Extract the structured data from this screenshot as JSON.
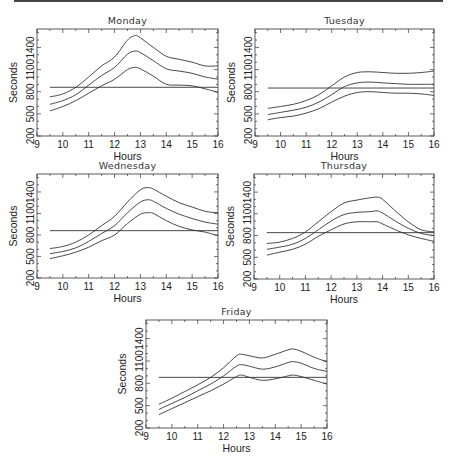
{
  "chart_data": [
    {
      "type": "line",
      "title": "Monday",
      "xlabel": "Hours",
      "ylabel": "Seconds",
      "xlim": [
        9,
        16
      ],
      "ylim": [
        200,
        1650
      ],
      "xticks": [
        9,
        10,
        11,
        12,
        13,
        14,
        15,
        16
      ],
      "yticks": [
        200,
        500,
        800,
        1100,
        1400
      ],
      "grid": false,
      "reference_line": 860,
      "x": [
        9.5,
        10,
        10.5,
        11,
        11.5,
        12,
        12.5,
        12.8,
        13,
        13.5,
        14,
        14.5,
        15,
        15.5,
        16
      ],
      "series": [
        {
          "name": "upper",
          "values": [
            730,
            770,
            860,
            1000,
            1150,
            1270,
            1500,
            1560,
            1530,
            1400,
            1280,
            1240,
            1200,
            1150,
            1150
          ]
        },
        {
          "name": "middle",
          "values": [
            630,
            680,
            760,
            890,
            1020,
            1130,
            1310,
            1350,
            1330,
            1220,
            1110,
            1080,
            1050,
            1000,
            970
          ]
        },
        {
          "name": "lower",
          "values": [
            540,
            600,
            680,
            780,
            880,
            970,
            1100,
            1130,
            1110,
            1010,
            900,
            890,
            880,
            840,
            790
          ]
        }
      ]
    },
    {
      "type": "line",
      "title": "Tuesday",
      "xlabel": "Hours",
      "ylabel": "Seconds",
      "xlim": [
        9,
        16
      ],
      "ylim": [
        200,
        1650
      ],
      "xticks": [
        9,
        10,
        11,
        12,
        13,
        14,
        15,
        16
      ],
      "yticks": [
        200,
        500,
        800,
        1100,
        1400
      ],
      "grid": false,
      "reference_line": 850,
      "x": [
        9.5,
        10,
        10.5,
        11,
        11.5,
        12,
        12.5,
        13,
        13.5,
        14,
        14.5,
        15,
        15.5,
        16
      ],
      "series": [
        {
          "name": "upper",
          "values": [
            575,
            600,
            630,
            680,
            760,
            880,
            1000,
            1060,
            1070,
            1060,
            1050,
            1050,
            1060,
            1080
          ]
        },
        {
          "name": "middle",
          "values": [
            490,
            520,
            550,
            590,
            660,
            760,
            870,
            920,
            930,
            920,
            910,
            900,
            900,
            900
          ]
        },
        {
          "name": "lower",
          "values": [
            420,
            450,
            470,
            510,
            570,
            660,
            740,
            790,
            800,
            790,
            780,
            780,
            770,
            750
          ]
        }
      ]
    },
    {
      "type": "line",
      "title": "Wednesday",
      "xlabel": "Hours",
      "ylabel": "Seconds",
      "xlim": [
        9,
        16
      ],
      "ylim": [
        200,
        1650
      ],
      "xticks": [
        9,
        10,
        11,
        12,
        13,
        14,
        15,
        16
      ],
      "yticks": [
        200,
        500,
        800,
        1100,
        1400
      ],
      "grid": false,
      "reference_line": 860,
      "x": [
        9.5,
        10,
        10.5,
        11,
        11.5,
        12,
        12.5,
        13,
        13.3,
        13.5,
        14,
        14.5,
        15,
        15.5,
        16
      ],
      "series": [
        {
          "name": "upper",
          "values": [
            610,
            640,
            700,
            800,
            930,
            1060,
            1260,
            1430,
            1460,
            1440,
            1340,
            1250,
            1190,
            1130,
            1110
          ]
        },
        {
          "name": "middle",
          "values": [
            540,
            570,
            620,
            710,
            820,
            930,
            1110,
            1260,
            1290,
            1270,
            1170,
            1090,
            1030,
            980,
            950
          ]
        },
        {
          "name": "lower",
          "values": [
            470,
            510,
            560,
            630,
            720,
            800,
            960,
            1090,
            1110,
            1100,
            1000,
            920,
            870,
            840,
            790
          ]
        }
      ]
    },
    {
      "type": "line",
      "title": "Thursday",
      "xlabel": "Hours",
      "ylabel": "Seconds",
      "xlim": [
        9,
        16
      ],
      "ylim": [
        200,
        1650
      ],
      "xticks": [
        9,
        10,
        11,
        12,
        13,
        14,
        15,
        16
      ],
      "yticks": [
        200,
        500,
        800,
        1100,
        1400
      ],
      "grid": false,
      "reference_line": 840,
      "x": [
        9.5,
        10,
        10.5,
        11,
        11.5,
        12,
        12.5,
        13,
        13.5,
        13.8,
        14,
        14.5,
        15,
        15.5,
        16
      ],
      "series": [
        {
          "name": "upper",
          "values": [
            690,
            710,
            760,
            850,
            990,
            1130,
            1250,
            1290,
            1320,
            1330,
            1300,
            1140,
            990,
            880,
            850
          ]
        },
        {
          "name": "middle",
          "values": [
            610,
            640,
            680,
            760,
            880,
            1000,
            1090,
            1120,
            1130,
            1140,
            1110,
            1000,
            900,
            830,
            800
          ]
        },
        {
          "name": "lower",
          "values": [
            530,
            570,
            610,
            680,
            790,
            880,
            960,
            990,
            990,
            990,
            960,
            880,
            810,
            760,
            720
          ]
        }
      ]
    },
    {
      "type": "line",
      "title": "Friday",
      "xlabel": "Hours",
      "ylabel": "Seconds",
      "xlim": [
        9,
        16
      ],
      "ylim": [
        200,
        1650
      ],
      "xticks": [
        9,
        10,
        11,
        12,
        13,
        14,
        15,
        16
      ],
      "yticks": [
        200,
        500,
        800,
        1100,
        1400
      ],
      "grid": false,
      "reference_line": 880,
      "x": [
        9.5,
        10,
        10.5,
        11,
        11.5,
        12,
        12.5,
        12.7,
        13,
        13.5,
        14,
        14.5,
        14.7,
        15,
        15.5,
        16
      ],
      "series": [
        {
          "name": "upper",
          "values": [
            520,
            600,
            690,
            780,
            880,
            1010,
            1170,
            1190,
            1170,
            1140,
            1190,
            1250,
            1260,
            1230,
            1150,
            1090
          ]
        },
        {
          "name": "middle",
          "values": [
            450,
            530,
            610,
            700,
            790,
            900,
            1030,
            1050,
            1030,
            990,
            1020,
            1080,
            1090,
            1070,
            1000,
            960
          ]
        },
        {
          "name": "lower",
          "values": [
            380,
            460,
            540,
            620,
            700,
            790,
            890,
            910,
            880,
            840,
            860,
            900,
            910,
            890,
            840,
            790
          ]
        }
      ]
    }
  ]
}
